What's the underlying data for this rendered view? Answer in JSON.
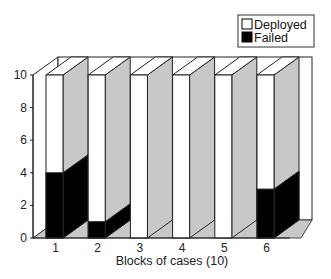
{
  "chart_data": {
    "type": "bar",
    "style": "3d-stacked",
    "title": "",
    "xlabel": "Blocks of cases (10)",
    "ylabel": "",
    "ylim": [
      0,
      10
    ],
    "yticks": [
      0,
      2,
      4,
      6,
      8,
      10
    ],
    "categories": [
      "1",
      "2",
      "3",
      "4",
      "5",
      "6"
    ],
    "series": [
      {
        "name": "Failed",
        "values": [
          4,
          1,
          0,
          0,
          0,
          3
        ],
        "color": "#000000"
      },
      {
        "name": "Deployed",
        "values": [
          6,
          9,
          10,
          10,
          10,
          7
        ],
        "color": "#ffffff"
      }
    ],
    "totals": [
      10,
      10,
      10,
      10,
      10,
      10
    ],
    "legend": {
      "position": "top-right",
      "entries": [
        {
          "label": "Deployed",
          "color": "#ffffff"
        },
        {
          "label": "Failed",
          "color": "#000000"
        }
      ]
    },
    "grid": false,
    "side_face_color": "#c8c8c8"
  },
  "labels": {
    "xlabel": "Blocks of cases (10)",
    "legend_deployed": "Deployed",
    "legend_failed": "Failed"
  }
}
